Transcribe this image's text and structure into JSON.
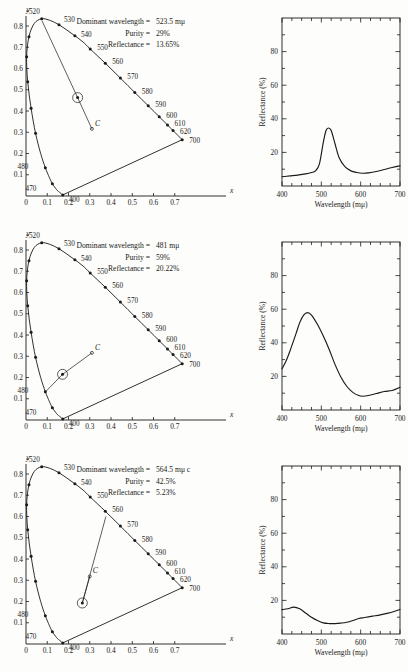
{
  "figure": {
    "panel_count": 3,
    "cie": {
      "x_axis_label": "x",
      "y_axis_label": "y",
      "x_ticks": [
        "0",
        "0.1",
        "0.2",
        "0.3",
        "0.4",
        "0.5",
        "0.6",
        "0.7"
      ],
      "y_ticks": [
        "0.1",
        "0.2",
        "0.3",
        "0.4",
        "0.5",
        "0.6",
        "0.7",
        "0.8"
      ],
      "wavelength_labels": [
        "400",
        "470",
        "480",
        "520",
        "530",
        "540",
        "550",
        "560",
        "570",
        "580",
        "590",
        "600",
        "610",
        "620",
        "700"
      ],
      "illuminant_label": "C"
    },
    "reflectance": {
      "x_axis_title": "Wavelength (mμ)",
      "y_axis_title": "Reflectance (%)",
      "x_ticks": [
        "400",
        "500",
        "600",
        "700"
      ],
      "y_ticks": [
        "20",
        "40",
        "60",
        "80"
      ],
      "xlim": [
        400,
        700
      ],
      "ylim": [
        0,
        100
      ]
    },
    "labels": {
      "dominant_wavelength": "Dominant wavelength =",
      "purity": "Purity =",
      "reflectance": "Reflectance ="
    }
  },
  "panels": [
    {
      "id": "panel-green",
      "dominant_wavelength": "523.5 mμ",
      "purity": "29%",
      "reflectance": "13.65%",
      "sample_point": {
        "x": 0.243,
        "y": 0.463
      },
      "illuminant_c": {
        "x": 0.31,
        "y": 0.316
      },
      "dominant_end": {
        "x": 0.075,
        "y": 0.825
      },
      "chart_data": {
        "type": "line",
        "title": "",
        "xlabel": "Wavelength (mμ)",
        "ylabel": "Reflectance (%)",
        "xlim": [
          400,
          700
        ],
        "ylim": [
          0,
          100
        ],
        "grid": false,
        "legend": "none",
        "x": [
          400,
          420,
          440,
          460,
          475,
          485,
          495,
          505,
          512,
          518,
          525,
          535,
          545,
          560,
          575,
          590,
          605,
          620,
          640,
          660,
          680,
          700
        ],
        "values": [
          5.5,
          6.0,
          6.5,
          7.2,
          8.0,
          9.0,
          13.0,
          26.0,
          33.0,
          34.5,
          33.0,
          25.0,
          17.0,
          11.5,
          9.0,
          8.0,
          7.6,
          7.8,
          8.6,
          9.8,
          11.0,
          12.0
        ]
      }
    },
    {
      "id": "panel-blue",
      "dominant_wavelength": "481 mμ",
      "purity": "59%",
      "reflectance": "20.22%",
      "sample_point": {
        "x": 0.172,
        "y": 0.215
      },
      "illuminant_c": {
        "x": 0.31,
        "y": 0.316
      },
      "dominant_end": {
        "x": 0.092,
        "y": 0.133
      },
      "chart_data": {
        "type": "line",
        "title": "",
        "xlabel": "Wavelength (mμ)",
        "ylabel": "Reflectance (%)",
        "xlim": [
          400,
          700
        ],
        "ylim": [
          0,
          100
        ],
        "grid": false,
        "legend": "none",
        "x": [
          400,
          410,
          420,
          435,
          445,
          455,
          465,
          475,
          490,
          505,
          520,
          535,
          550,
          565,
          580,
          595,
          605,
          620,
          640,
          660,
          680,
          700
        ],
        "values": [
          24.5,
          29.0,
          35.0,
          45.0,
          52.0,
          56.5,
          58.0,
          56.5,
          51.0,
          44.0,
          36.0,
          27.0,
          19.5,
          14.0,
          10.5,
          8.6,
          8.2,
          8.6,
          9.8,
          11.0,
          11.6,
          13.5
        ]
      }
    },
    {
      "id": "panel-yellow",
      "dominant_wavelength": "564.5 mμ c",
      "purity": "42.5%",
      "reflectance": "5.23%",
      "sample_point": {
        "x": 0.265,
        "y": 0.193
      },
      "illuminant_c": {
        "x": 0.3,
        "y": 0.318
      },
      "dominant_end": {
        "x": 0.376,
        "y": 0.6
      },
      "chart_data": {
        "type": "line",
        "title": "",
        "xlabel": "Wavelength (mμ)",
        "ylabel": "Reflectance (%)",
        "xlim": [
          400,
          700
        ],
        "ylim": [
          0,
          100
        ],
        "grid": false,
        "legend": "none",
        "x": [
          400,
          415,
          430,
          445,
          460,
          475,
          490,
          505,
          520,
          535,
          550,
          565,
          580,
          595,
          610,
          630,
          650,
          670,
          685,
          700
        ],
        "values": [
          14.5,
          15.0,
          16.0,
          15.0,
          12.5,
          10.0,
          8.0,
          6.6,
          6.2,
          6.2,
          6.5,
          7.0,
          8.0,
          9.2,
          9.8,
          10.6,
          11.4,
          12.4,
          13.4,
          14.6
        ]
      }
    }
  ],
  "cie_locus": {
    "comment": "CIE 1931 spectral locus vertices used to draw the horseshoe outline",
    "points": [
      {
        "w": 400,
        "x": 0.173,
        "y": 0.005
      },
      {
        "w": 450,
        "x": 0.157,
        "y": 0.018
      },
      {
        "w": 460,
        "x": 0.144,
        "y": 0.03
      },
      {
        "w": 470,
        "x": 0.124,
        "y": 0.058
      },
      {
        "w": 475,
        "x": 0.11,
        "y": 0.087
      },
      {
        "w": 480,
        "x": 0.091,
        "y": 0.133
      },
      {
        "w": 485,
        "x": 0.069,
        "y": 0.2
      },
      {
        "w": 490,
        "x": 0.045,
        "y": 0.295
      },
      {
        "w": 495,
        "x": 0.024,
        "y": 0.413
      },
      {
        "w": 500,
        "x": 0.008,
        "y": 0.538
      },
      {
        "w": 505,
        "x": 0.003,
        "y": 0.655
      },
      {
        "w": 510,
        "x": 0.014,
        "y": 0.75
      },
      {
        "w": 515,
        "x": 0.039,
        "y": 0.812
      },
      {
        "w": 520,
        "x": 0.074,
        "y": 0.834
      },
      {
        "w": 525,
        "x": 0.114,
        "y": 0.826
      },
      {
        "w": 530,
        "x": 0.155,
        "y": 0.806
      },
      {
        "w": 535,
        "x": 0.192,
        "y": 0.781
      },
      {
        "w": 540,
        "x": 0.23,
        "y": 0.754
      },
      {
        "w": 545,
        "x": 0.268,
        "y": 0.725
      },
      {
        "w": 550,
        "x": 0.302,
        "y": 0.692
      },
      {
        "w": 560,
        "x": 0.373,
        "y": 0.625
      },
      {
        "w": 570,
        "x": 0.444,
        "y": 0.555
      },
      {
        "w": 580,
        "x": 0.512,
        "y": 0.487
      },
      {
        "w": 590,
        "x": 0.575,
        "y": 0.425
      },
      {
        "w": 600,
        "x": 0.627,
        "y": 0.373
      },
      {
        "w": 610,
        "x": 0.666,
        "y": 0.334
      },
      {
        "w": 620,
        "x": 0.692,
        "y": 0.308
      },
      {
        "w": 630,
        "x": 0.709,
        "y": 0.291
      },
      {
        "w": 700,
        "x": 0.735,
        "y": 0.265
      }
    ],
    "marked": [
      400,
      470,
      480,
      490,
      495,
      500,
      505,
      510,
      520,
      530,
      540,
      550,
      560,
      570,
      580,
      590,
      600,
      610,
      620,
      700
    ],
    "label_offsets": {
      "400": [
        6,
        7
      ],
      "470": [
        -16,
        7
      ],
      "480": [
        -17,
        1
      ],
      "520": [
        -2,
        -5
      ],
      "530": [
        5,
        -3
      ],
      "540": [
        6,
        1
      ],
      "550": [
        7,
        1
      ],
      "560": [
        7,
        1
      ],
      "570": [
        7,
        1
      ],
      "580": [
        7,
        1
      ],
      "590": [
        7,
        1
      ],
      "600": [
        7,
        1
      ],
      "610": [
        7,
        1
      ],
      "620": [
        7,
        3
      ],
      "700": [
        7,
        3
      ]
    }
  }
}
